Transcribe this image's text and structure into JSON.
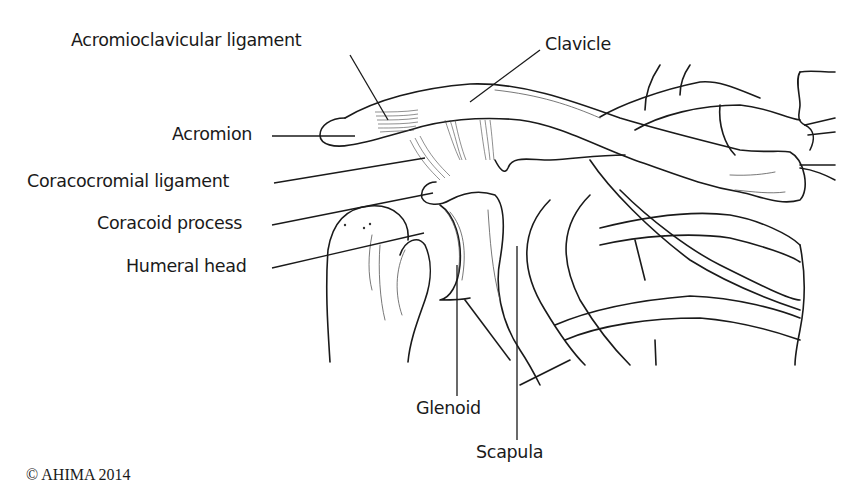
{
  "diagram": {
    "labels": {
      "acromioclavicular_ligament": "Acromioclavicular ligament",
      "clavicle": "Clavicle",
      "acromion": "Acromion",
      "coracocromial_ligament": "Coracocromial ligament",
      "coracoid_process": "Coracoid process",
      "humeral_head": "Humeral head",
      "glenoid": "Glenoid",
      "scapula": "Scapula"
    },
    "copyright": "© AHIMA 2014"
  }
}
